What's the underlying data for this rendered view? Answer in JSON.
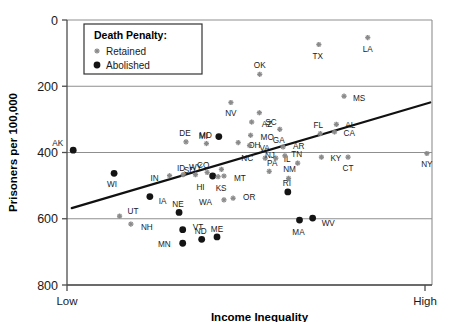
{
  "chart_data": {
    "type": "scatter",
    "title": "",
    "xlabel": "Income Inequality",
    "ylabel": "Prisoners per 100,000",
    "ylim": [
      0,
      800
    ],
    "yticks": [
      0,
      200,
      400,
      600,
      800
    ],
    "xticklabels": [
      "Low",
      "High"
    ],
    "grid": "horizontal",
    "legend": {
      "title": "Death Penalty:",
      "position": "top-left-inside",
      "entries": [
        {
          "label": "Retained",
          "marker": "small-gray-star",
          "color": "#808080"
        },
        {
          "label": "Abolished",
          "marker": "black-dot",
          "color": "#111111"
        }
      ]
    },
    "trendline": {
      "x0": 0.013,
      "y0": 232,
      "x1": 0.995,
      "y1": 551,
      "color": "#111111"
    },
    "points": [
      {
        "label": "AK",
        "group": "Abolished",
        "x": 0.017,
        "y": 407,
        "lx": -10,
        "ly": -7
      },
      {
        "label": "WI",
        "group": "Abolished",
        "x": 0.129,
        "y": 337,
        "lx": -2,
        "ly": 11
      },
      {
        "label": "UT",
        "group": "Retained",
        "x": 0.144,
        "y": 208,
        "lx": 8,
        "ly": -5
      },
      {
        "label": "NH",
        "group": "Retained",
        "x": 0.175,
        "y": 184,
        "lx": 10,
        "ly": 3
      },
      {
        "label": "IA",
        "group": "Abolished",
        "x": 0.227,
        "y": 267,
        "lx": 9,
        "ly": 4
      },
      {
        "label": "IN",
        "group": "Retained",
        "x": 0.281,
        "y": 330,
        "lx": -11,
        "ly": 2
      },
      {
        "label": "MN",
        "group": "Abolished",
        "x": 0.317,
        "y": 126,
        "lx": -12,
        "ly": 1
      },
      {
        "label": "NE",
        "group": "Abolished",
        "x": 0.307,
        "y": 219,
        "lx": -1,
        "ly": -8
      },
      {
        "label": "VT",
        "group": "Abolished",
        "x": 0.317,
        "y": 167,
        "lx": 10,
        "ly": -3
      },
      {
        "label": "ID",
        "group": "Retained",
        "x": 0.318,
        "y": 333,
        "lx": -2,
        "ly": -7
      },
      {
        "label": "DE",
        "group": "Retained",
        "x": 0.326,
        "y": 432,
        "lx": -1,
        "ly": -9
      },
      {
        "label": "WY",
        "group": "Retained",
        "x": 0.352,
        "y": 333,
        "lx": 0,
        "ly": -8
      },
      {
        "label": "ND",
        "group": "Abolished",
        "x": 0.369,
        "y": 138,
        "lx": -1,
        "ly": -8
      },
      {
        "label": "MD",
        "group": "Retained",
        "x": 0.382,
        "y": 427,
        "lx": -1,
        "ly": -9
      },
      {
        "label": "SD",
        "group": "Retained",
        "x": 0.384,
        "y": 340,
        "lx": -12,
        "ly": -2
      },
      {
        "label": "HI",
        "group": "Abolished",
        "x": 0.399,
        "y": 329,
        "lx": -8,
        "ly": 11
      },
      {
        "label": "ME",
        "group": "Abolished",
        "x": 0.411,
        "y": 145,
        "lx": 0,
        "ly": -8
      },
      {
        "label": "KS",
        "group": "Retained",
        "x": 0.414,
        "y": 327,
        "lx": 3,
        "ly": 11
      },
      {
        "label": "MI",
        "group": "Abolished",
        "x": 0.416,
        "y": 448,
        "lx": -11,
        "ly": -1
      },
      {
        "label": "CO",
        "group": "Retained",
        "x": 0.423,
        "y": 349,
        "lx": -12,
        "ly": -4
      },
      {
        "label": "MT",
        "group": "Retained",
        "x": 0.43,
        "y": 329,
        "lx": 10,
        "ly": 2
      },
      {
        "label": "WA",
        "group": "Retained",
        "x": 0.43,
        "y": 257,
        "lx": -12,
        "ly": 2
      },
      {
        "label": "OR",
        "group": "Retained",
        "x": 0.455,
        "y": 262,
        "lx": 10,
        "ly": -1
      },
      {
        "label": "NV",
        "group": "Retained",
        "x": 0.449,
        "y": 551,
        "lx": 0,
        "ly": 11
      },
      {
        "label": "OH",
        "group": "Retained",
        "x": 0.469,
        "y": 430,
        "lx": 10,
        "ly": 2
      },
      {
        "label": "AZ",
        "group": "Retained",
        "x": 0.506,
        "y": 492,
        "lx": 10,
        "ly": 2
      },
      {
        "label": "VA",
        "group": "Retained",
        "x": 0.5,
        "y": 421,
        "lx": 10,
        "ly": 2
      },
      {
        "label": "MO",
        "group": "Retained",
        "x": 0.503,
        "y": 452,
        "lx": 10,
        "ly": 2
      },
      {
        "label": "SC",
        "group": "Retained",
        "x": 0.527,
        "y": 520,
        "lx": 6,
        "ly": 9
      },
      {
        "label": "OK",
        "group": "Retained",
        "x": 0.528,
        "y": 636,
        "lx": 0,
        "ly": -9
      },
      {
        "label": "NC",
        "group": "Retained",
        "x": 0.543,
        "y": 383,
        "lx": -12,
        "ly": 0
      },
      {
        "label": "PA",
        "group": "Retained",
        "x": 0.554,
        "y": 343,
        "lx": 3,
        "ly": -8
      },
      {
        "label": "IL",
        "group": "Retained",
        "x": 0.572,
        "y": 383,
        "lx": 8,
        "ly": 1
      },
      {
        "label": "GA",
        "group": "Retained",
        "x": 0.583,
        "y": 470,
        "lx": -1,
        "ly": 11
      },
      {
        "label": "NJ",
        "group": "Retained",
        "x": 0.597,
        "y": 390,
        "lx": -10,
        "ly": -1
      },
      {
        "label": "AR",
        "group": "Retained",
        "x": 0.592,
        "y": 417,
        "lx": 10,
        "ly": -1
      },
      {
        "label": "NM",
        "group": "Retained",
        "x": 0.607,
        "y": 322,
        "lx": 1,
        "ly": -9
      },
      {
        "label": "RI",
        "group": "Abolished",
        "x": 0.605,
        "y": 281,
        "lx": -1,
        "ly": -9
      },
      {
        "label": "TN",
        "group": "Retained",
        "x": 0.632,
        "y": 368,
        "lx": -1,
        "ly": -9
      },
      {
        "label": "MA",
        "group": "Abolished",
        "x": 0.637,
        "y": 196,
        "lx": -1,
        "ly": 12
      },
      {
        "label": "WV",
        "group": "Abolished",
        "x": 0.673,
        "y": 202,
        "lx": 9,
        "ly": 5
      },
      {
        "label": "TX",
        "group": "Retained",
        "x": 0.69,
        "y": 726,
        "lx": -1,
        "ly": 11
      },
      {
        "label": "FL",
        "group": "Retained",
        "x": 0.694,
        "y": 457,
        "lx": -2,
        "ly": -9
      },
      {
        "label": "KY",
        "group": "Retained",
        "x": 0.697,
        "y": 386,
        "lx": 9,
        "ly": 1
      },
      {
        "label": "CA",
        "group": "Retained",
        "x": 0.733,
        "y": 462,
        "lx": 9,
        "ly": 1
      },
      {
        "label": "AL",
        "group": "Retained",
        "x": 0.738,
        "y": 485,
        "lx": 9,
        "ly": 1
      },
      {
        "label": "MS",
        "group": "Retained",
        "x": 0.759,
        "y": 570,
        "lx": 9,
        "ly": 2
      },
      {
        "label": "CT",
        "group": "Retained",
        "x": 0.77,
        "y": 386,
        "lx": 0,
        "ly": 11
      },
      {
        "label": "LA",
        "group": "Retained",
        "x": 0.824,
        "y": 747,
        "lx": 0,
        "ly": 11
      },
      {
        "label": "NY",
        "group": "Retained",
        "x": 0.986,
        "y": 397,
        "lx": 0,
        "ly": 11
      }
    ]
  },
  "axis": {
    "y_ticks_text": [
      "800",
      "600",
      "400",
      "200",
      "0"
    ],
    "y_title": "Prisoners per 100,000",
    "x_title": "Income Inequality",
    "x_low": "Low",
    "x_high": "High"
  },
  "legend": {
    "title": "Death Penalty:",
    "retained": "Retained",
    "abolished": "Abolished"
  },
  "colors": {
    "retained": "#8a8a8a",
    "abolished": "#141414",
    "grid": "#8f8f8f",
    "axis": "#4d4d4d",
    "trend": "#111111"
  }
}
